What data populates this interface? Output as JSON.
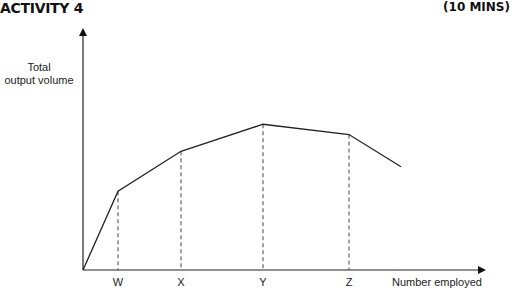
{
  "header": {
    "title": "ACTIVITY 4",
    "duration": "(10 MINS)"
  },
  "chart_data": {
    "type": "line",
    "title": "ACTIVITY 4",
    "ylabel": "Total output volume",
    "ylabel_lines": [
      "Total",
      "output volume"
    ],
    "xlabel": "Number employed",
    "tick_labels": [
      "W",
      "X",
      "Y",
      "Z"
    ],
    "grid": false,
    "legend": null,
    "annotations": "Dashed vertical drop lines from curve to x-axis at W, X, Y and Z",
    "points": [
      {
        "label": "origin",
        "x": 0,
        "y": 0
      },
      {
        "label": "W",
        "x": 1,
        "y": 0.61
      },
      {
        "label": "X",
        "x": 2,
        "y": 0.92
      },
      {
        "label": "Y",
        "x": 3,
        "y": 1.13
      },
      {
        "label": "Z",
        "x": 4,
        "y": 1.05
      },
      {
        "label": "end",
        "x": 4.6,
        "y": 0.8
      }
    ],
    "xlim": [
      0,
      5
    ],
    "ylim": [
      0,
      1.9
    ]
  }
}
